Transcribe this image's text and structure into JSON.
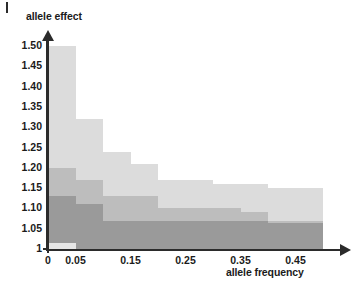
{
  "chart_data": {
    "type": "bar",
    "title": "",
    "xlabel": "allele frequency",
    "ylabel": "allele effect",
    "xlim": [
      0,
      0.52
    ],
    "ylim": [
      1.0,
      1.52
    ],
    "grid": false,
    "legend": null,
    "x_ticks": [
      "0",
      "0.05",
      "0.15",
      "0.25",
      "0.35",
      "0.45"
    ],
    "x_tick_values": [
      0,
      0.05,
      0.15,
      0.25,
      0.35,
      0.45
    ],
    "y_ticks": [
      "1",
      "1.05",
      "1.10",
      "1.15",
      "1.20",
      "1.25",
      "1.30",
      "1.35",
      "1.40",
      "1.45",
      "1.50"
    ],
    "y_tick_values": [
      1.0,
      1.05,
      1.1,
      1.15,
      1.2,
      1.25,
      1.3,
      1.35,
      1.4,
      1.45,
      1.5
    ],
    "bin_edges": [
      0.0,
      0.05,
      0.1,
      0.15,
      0.2,
      0.25,
      0.3,
      0.35,
      0.4,
      0.45,
      0.5
    ],
    "series": [
      {
        "name": "light",
        "color": "#dcdcdc",
        "values": [
          1.5,
          1.32,
          1.24,
          1.21,
          1.17,
          1.17,
          1.16,
          1.16,
          1.15,
          1.15
        ]
      },
      {
        "name": "medium",
        "color": "#bdbdbd",
        "values": [
          1.2,
          1.17,
          1.13,
          1.13,
          1.1,
          1.1,
          1.1,
          1.09,
          1.07,
          1.07
        ]
      },
      {
        "name": "dark",
        "color": "#9a9a9a",
        "values": [
          1.13,
          1.11,
          1.07,
          1.07,
          1.07,
          1.07,
          1.07,
          1.07,
          1.065,
          1.065
        ]
      },
      {
        "name": "baseline",
        "color": "#e6e6e6",
        "values": [
          1.015,
          1.0,
          1.0,
          1.0,
          1.0,
          1.0,
          1.0,
          1.0,
          1.0,
          1.0
        ]
      }
    ]
  }
}
